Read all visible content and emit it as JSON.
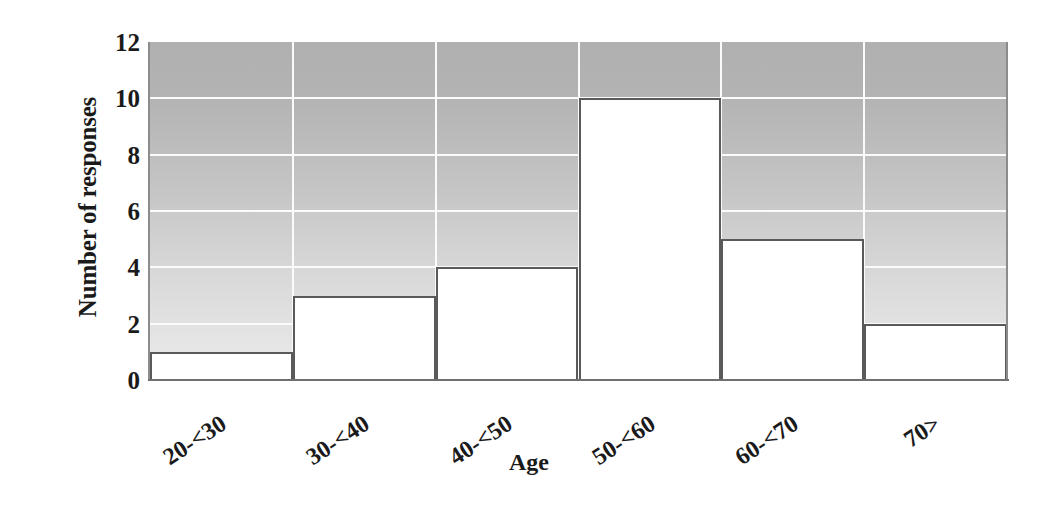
{
  "chart_data": {
    "type": "bar",
    "title": "",
    "subtitle": "",
    "xlabel": "Age",
    "ylabel": "Number of responses",
    "categories": [
      "20-<30",
      "30-<40",
      "40-<50",
      "50-<60",
      "60-<70",
      "70>"
    ],
    "values": [
      1,
      3,
      4,
      10,
      5,
      2
    ],
    "ylim": [
      0,
      12
    ],
    "ytick_step": 2,
    "yticks": [
      0,
      2,
      4,
      6,
      8,
      10,
      12
    ],
    "ytick_labels": [
      "0",
      "2",
      "4",
      "6",
      "8",
      "10",
      "12"
    ],
    "grid": true,
    "grid_orientation": "both",
    "grid_color": "#fbfbfb",
    "legend": false,
    "legend_position": "none",
    "bar_fill_color": "#ffffff",
    "bar_border_color": "#5a5a5a",
    "bar_gap": 0,
    "plot_background": "vertical-gradient-gray",
    "plot_background_top_color": "#b0b0b0",
    "plot_background_bottom_color": "#eaeaea",
    "axis_line_color": "#707070",
    "text_color": "#1a1a1a",
    "xtick_rotation_degrees": -33,
    "annotations": []
  }
}
